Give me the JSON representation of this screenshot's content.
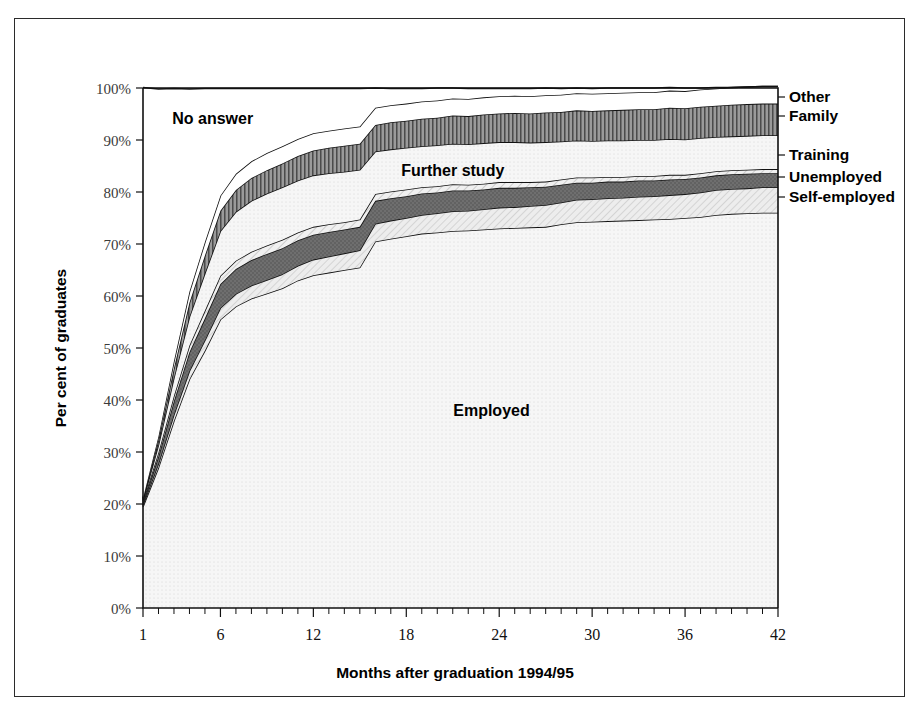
{
  "figure": {
    "frame_present": true,
    "background": "#ffffff"
  },
  "chart_data": {
    "type": "area",
    "stacked": true,
    "title": "",
    "xlabel": "Months after graduation 1994/95",
    "ylabel": "Per cent of graduates",
    "xlim": [
      1,
      42
    ],
    "ylim": [
      0,
      100
    ],
    "grid": false,
    "legend_position": "right-outside",
    "x_tick_labels": [
      "1",
      "6",
      "12",
      "18",
      "24",
      "30",
      "36",
      "42"
    ],
    "x_ticks": [
      1,
      6,
      12,
      18,
      24,
      30,
      36,
      42
    ],
    "x_minor_tick_step": 1,
    "y_tick_labels": [
      "0%",
      "10%",
      "20%",
      "30%",
      "40%",
      "50%",
      "60%",
      "70%",
      "80%",
      "90%",
      "100%"
    ],
    "y_ticks": [
      0,
      10,
      20,
      30,
      40,
      50,
      60,
      70,
      80,
      90,
      100
    ],
    "x": [
      1,
      2,
      3,
      4,
      5,
      6,
      7,
      8,
      9,
      10,
      11,
      12,
      13,
      14,
      15,
      16,
      17,
      18,
      19,
      20,
      21,
      22,
      23,
      24,
      25,
      26,
      27,
      28,
      29,
      30,
      31,
      32,
      33,
      34,
      35,
      36,
      37,
      38,
      39,
      40,
      41,
      42
    ],
    "series": [
      {
        "name": "Employed",
        "fill": "light-dotted",
        "color": "#f2f2f2",
        "values": [
          19.5,
          27.0,
          36.0,
          44.0,
          49.5,
          55.5,
          58.0,
          59.5,
          60.5,
          61.5,
          63.0,
          64.0,
          64.5,
          65.0,
          65.5,
          70.5,
          71.0,
          71.5,
          72.0,
          72.2,
          72.5,
          72.6,
          72.8,
          73.0,
          73.1,
          73.2,
          73.3,
          73.8,
          74.2,
          74.3,
          74.4,
          74.5,
          74.6,
          74.7,
          74.8,
          75.0,
          75.2,
          75.6,
          75.8,
          75.9,
          76.0,
          76.0
        ]
      },
      {
        "name": "Self-employed",
        "fill": "diagonal-hatch-light",
        "color": "#dcdcdc",
        "values": [
          0.3,
          0.8,
          1.2,
          1.6,
          2.0,
          2.2,
          2.4,
          2.5,
          2.6,
          2.7,
          2.8,
          3.0,
          3.1,
          3.2,
          3.3,
          3.4,
          3.5,
          3.5,
          3.6,
          3.7,
          3.8,
          3.8,
          3.9,
          4.0,
          4.0,
          4.1,
          4.2,
          4.2,
          4.3,
          4.3,
          4.4,
          4.4,
          4.5,
          4.5,
          4.6,
          4.6,
          4.7,
          4.8,
          4.8,
          4.8,
          4.9,
          4.9
        ]
      },
      {
        "name": "Unemployed",
        "fill": "solid-dark-grey",
        "color": "#6e6e6e",
        "values": [
          0.4,
          1.4,
          2.6,
          3.6,
          4.2,
          4.6,
          4.8,
          4.9,
          5.0,
          5.0,
          4.9,
          4.8,
          4.7,
          4.6,
          4.5,
          4.4,
          4.3,
          4.2,
          4.1,
          4.0,
          4.0,
          3.9,
          3.8,
          3.8,
          3.7,
          3.6,
          3.5,
          3.4,
          3.3,
          3.2,
          3.2,
          3.1,
          3.1,
          3.0,
          3.0,
          2.9,
          2.9,
          2.8,
          2.8,
          2.8,
          2.7,
          2.7
        ]
      },
      {
        "name": "Training",
        "fill": "diagonal-hatch-light",
        "color": "#e8e8e8",
        "values": [
          0.3,
          0.7,
          1.0,
          1.3,
          1.5,
          1.6,
          1.6,
          1.6,
          1.6,
          1.6,
          1.5,
          1.5,
          1.5,
          1.4,
          1.4,
          1.3,
          1.3,
          1.3,
          1.2,
          1.2,
          1.2,
          1.1,
          1.1,
          1.1,
          1.1,
          1.0,
          1.0,
          1.0,
          1.0,
          1.0,
          0.9,
          0.9,
          0.9,
          0.9,
          0.9,
          0.8,
          0.8,
          0.8,
          0.8,
          0.8,
          0.8,
          0.8
        ]
      },
      {
        "name": "Further study",
        "fill": "light-dotted",
        "color": "#efefef",
        "values": [
          0.2,
          1.5,
          3.5,
          5.5,
          7.2,
          8.6,
          9.4,
          9.8,
          10.0,
          10.1,
          10.0,
          9.9,
          9.8,
          9.7,
          9.6,
          8.2,
          8.1,
          8.0,
          7.9,
          7.9,
          7.8,
          7.8,
          7.8,
          7.7,
          7.7,
          7.6,
          7.6,
          7.3,
          7.1,
          7.0,
          7.0,
          7.0,
          6.9,
          6.9,
          6.9,
          6.8,
          6.8,
          6.6,
          6.5,
          6.5,
          6.5,
          6.5
        ]
      },
      {
        "name": "Family",
        "fill": "vertical-stripes",
        "color": "#8a8a8a",
        "values": [
          0.2,
          0.9,
          1.8,
          2.7,
          3.4,
          3.9,
          4.2,
          4.4,
          4.5,
          4.6,
          4.7,
          4.8,
          4.9,
          5.0,
          5.0,
          5.1,
          5.2,
          5.2,
          5.3,
          5.3,
          5.4,
          5.4,
          5.5,
          5.5,
          5.6,
          5.6,
          5.7,
          5.7,
          5.8,
          5.8,
          5.8,
          5.9,
          5.9,
          5.9,
          6.0,
          6.0,
          6.0,
          6.0,
          6.1,
          6.1,
          6.1,
          6.1
        ]
      },
      {
        "name": "Other",
        "fill": "white",
        "color": "#ffffff",
        "values": [
          0.2,
          0.7,
          1.4,
          2.1,
          2.6,
          2.9,
          3.1,
          3.2,
          3.3,
          3.3,
          3.3,
          3.3,
          3.3,
          3.3,
          3.3,
          3.3,
          3.3,
          3.3,
          3.3,
          3.3,
          3.3,
          3.3,
          3.3,
          3.3,
          3.3,
          3.3,
          3.3,
          3.3,
          3.3,
          3.3,
          3.3,
          3.3,
          3.3,
          3.3,
          3.3,
          3.3,
          3.3,
          3.3,
          3.3,
          3.3,
          3.3,
          3.3
        ]
      },
      {
        "name": "No answer",
        "fill": "white",
        "color": "#ffffff",
        "values": [
          79.0,
          66.8,
          52.4,
          39.0,
          29.5,
          20.6,
          16.4,
          14.0,
          12.4,
          11.1,
          9.7,
          8.6,
          8.1,
          7.7,
          7.3,
          3.8,
          3.2,
          2.9,
          2.5,
          2.4,
          2.0,
          2.0,
          1.7,
          1.5,
          1.4,
          1.5,
          1.4,
          1.2,
          1.0,
          1.0,
          1.0,
          0.9,
          0.8,
          0.8,
          0.6,
          0.6,
          0.3,
          0.2,
          0.0,
          0.0,
          0.0,
          0.0
        ]
      }
    ],
    "annotations": [
      {
        "text": "No answer",
        "x_month": 5.5,
        "y_pct": 93.0
      },
      {
        "text": "Further study",
        "x_month": 21.0,
        "y_pct": 83.0
      },
      {
        "text": "Employed",
        "x_month": 23.5,
        "y_pct": 37.0
      }
    ],
    "legend": [
      {
        "label": "Other",
        "fill": "white"
      },
      {
        "label": "Family",
        "fill": "vertical-stripes"
      },
      {
        "label": "Training",
        "fill": "diagonal-hatch-light"
      },
      {
        "label": "Unemployed",
        "fill": "solid-dark-grey"
      },
      {
        "label": "Self-employed",
        "fill": "light-dotted"
      }
    ]
  }
}
